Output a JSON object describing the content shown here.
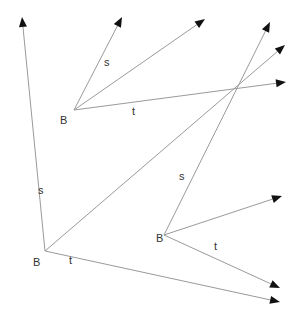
{
  "diagram": {
    "type": "vector-diagram",
    "colors": {
      "line": "#9a9a9a",
      "arrowhead": "#111111",
      "text": "#333333"
    },
    "frames": [
      {
        "id": "frame-bottom-left",
        "origin_label": "B",
        "origin": [
          45,
          251
        ],
        "origin_label_pos": [
          33,
          266
        ],
        "vectors": [
          {
            "id": "s",
            "label": "s",
            "to": [
              22,
              17
            ],
            "label_pos": [
              38,
              194
            ]
          },
          {
            "id": "diag",
            "label": "",
            "to": [
              285,
              45
            ],
            "label_pos": null
          },
          {
            "id": "t",
            "label": "t",
            "to": [
              280,
              302
            ],
            "label_pos": [
              69,
              264
            ]
          }
        ]
      },
      {
        "id": "frame-top",
        "origin_label": "B",
        "origin": [
          74,
          110
        ],
        "origin_label_pos": [
          60,
          124
        ],
        "vectors": [
          {
            "id": "s",
            "label": "s",
            "to": [
              122,
              17
            ],
            "label_pos": [
              104,
              66
            ]
          },
          {
            "id": "diag",
            "label": "",
            "to": [
              205,
              19
            ],
            "label_pos": null
          },
          {
            "id": "t",
            "label": "t",
            "to": [
              286,
              82
            ],
            "label_pos": [
              132,
              115
            ]
          }
        ]
      },
      {
        "id": "frame-bottom-right",
        "origin_label": "B",
        "origin": [
          164,
          235
        ],
        "origin_label_pos": [
          156,
          242
        ],
        "vectors": [
          {
            "id": "s",
            "label": "s",
            "to": [
              270,
              22
            ],
            "label_pos": [
              179,
              180
            ]
          },
          {
            "id": "diag",
            "label": "",
            "to": [
              282,
              196
            ],
            "label_pos": null
          },
          {
            "id": "t",
            "label": "t",
            "to": [
              280,
              288
            ],
            "label_pos": [
              214,
              250
            ]
          }
        ]
      }
    ]
  }
}
